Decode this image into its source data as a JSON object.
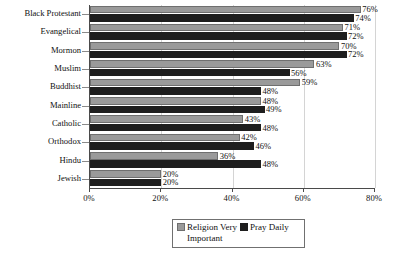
{
  "chart_data": {
    "type": "bar",
    "orientation": "horizontal",
    "title": "",
    "xlabel": "",
    "ylabel": "",
    "xlim": [
      0,
      80
    ],
    "xticks": [
      "0%",
      "20%",
      "40%",
      "60%",
      "80%"
    ],
    "xtick_values": [
      0,
      20,
      40,
      60,
      80
    ],
    "grid": true,
    "legend_position": "bottom",
    "categories": [
      "Black Protestant",
      "Evangelical",
      "Mormon",
      "Muslim",
      "Buddhist",
      "Mainline",
      "Catholic",
      "Orthodox",
      "Hindu",
      "Jewish"
    ],
    "series": [
      {
        "name": "Religion Very Important",
        "color": "#9a9a9a",
        "values": [
          76,
          71,
          70,
          63,
          59,
          48,
          43,
          42,
          36,
          20
        ],
        "labels": [
          "76%",
          "71%",
          "70%",
          "63%",
          "59%",
          "48%",
          "43%",
          "42%",
          "36%",
          "20%"
        ]
      },
      {
        "name": "Pray Daily",
        "color": "#1e1e1e",
        "values": [
          74,
          72,
          72,
          56,
          48,
          49,
          48,
          46,
          48,
          20
        ],
        "labels": [
          "74%",
          "72%",
          "72%",
          "56%",
          "48%",
          "49%",
          "48%",
          "46%",
          "48%",
          "20%"
        ]
      }
    ]
  },
  "legend": {
    "entries": [
      {
        "label_line1": "Religion Very",
        "label_line2": "Important"
      },
      {
        "label_line1": "Pray Daily",
        "label_line2": ""
      }
    ]
  }
}
